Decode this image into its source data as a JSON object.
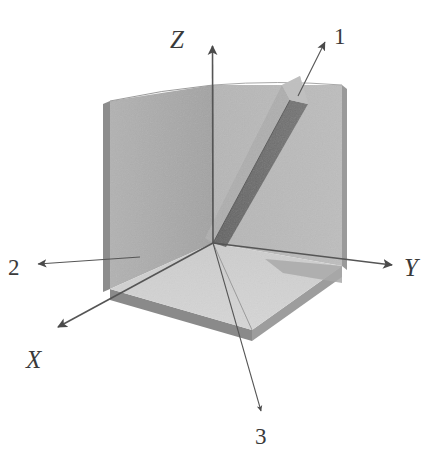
{
  "figure": {
    "type": "3d-coordinate-diagram",
    "title": "",
    "background_color": "#ffffff",
    "canvas": {
      "width": 436,
      "height": 453
    }
  },
  "colors": {
    "plane_left": "#a9a9a9",
    "plane_right": "#b9b9b9",
    "plane_bottom": "#d1d1d1",
    "plane_left_edge": "#8d8d8d",
    "plane_bottom_edge": "#8a8a8a",
    "slab_dark_face": "#6b6b6b",
    "slab_light_face": "#b0b0b0",
    "slab_top_face": "#c2c2c2",
    "shadow_band": "#9a9a9a",
    "line": "#555555",
    "text": "#3a3a3a"
  },
  "axes": [
    {
      "id": "z",
      "label": "Z",
      "style": "italic-serif",
      "description": "vertical axis pointing up",
      "arrow_from": [
        213,
        243
      ],
      "arrow_to": [
        212,
        38
      ],
      "label_pos": [
        184,
        48
      ]
    },
    {
      "id": "y",
      "label": "Y",
      "style": "italic-serif",
      "description": "axis pointing right",
      "arrow_from": [
        213,
        243
      ],
      "arrow_to": [
        398,
        266
      ],
      "label_pos": [
        408,
        276
      ]
    },
    {
      "id": "x",
      "label": "X",
      "style": "italic-serif",
      "description": "axis pointing down-left toward viewer",
      "arrow_from": [
        213,
        243
      ],
      "arrow_to": [
        52,
        330
      ],
      "label_pos": [
        28,
        362
      ]
    }
  ],
  "direction_markers": [
    {
      "id": "dir-1",
      "label": "1",
      "style": "upright-serif",
      "description": "thin arrow pointing up-right from end of diagonal slab",
      "arrow_from": [
        298,
        95
      ],
      "arrow_to": [
        330,
        35
      ],
      "label_pos": [
        337,
        40
      ]
    },
    {
      "id": "dir-2",
      "label": "2",
      "style": "upright-serif",
      "description": "thin arrow pointing left toward the left plane",
      "arrow_from": [
        138,
        258
      ],
      "arrow_to": [
        33,
        265
      ],
      "label_pos": [
        10,
        276
      ]
    },
    {
      "id": "dir-3",
      "label": "3",
      "style": "upright-serif",
      "description": "thin arrow pointing down-right from origin through the bottom plane",
      "arrow_from": [
        213,
        243
      ],
      "arrow_to": [
        262,
        415
      ],
      "label_pos": [
        258,
        443
      ]
    }
  ],
  "geometry": {
    "origin": [
      213,
      243
    ],
    "plane_left": {
      "name": "left vertical plane (X-Z plane)",
      "points": "110,101 213,85 213,243 110,289"
    },
    "plane_right": {
      "name": "right vertical plane (Y-Z plane)",
      "points": "213,85 342,85 342,266 213,243"
    },
    "plane_bottom": {
      "name": "bottom horizontal plane (X-Y plane)",
      "points": "110,289 213,243 342,266 252,330"
    },
    "slab": {
      "name": "inclined dark band / beam",
      "description": "a thin 3D slab rising from origin to the upper-right of the right plane, with a dark inclined face and a light top cap"
    }
  }
}
